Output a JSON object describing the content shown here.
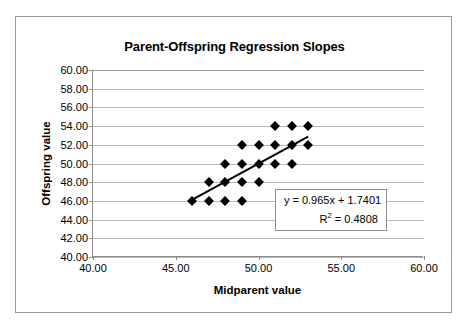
{
  "chart_data": {
    "type": "scatter",
    "title": "Parent-Offspring Regression Slopes",
    "xlabel": "Midparent value",
    "ylabel": "Offspring value",
    "xlim": [
      40.0,
      60.0
    ],
    "ylim": [
      40.0,
      60.0
    ],
    "xticks": [
      "40.00",
      "45.00",
      "50.00",
      "55.00",
      "60.00"
    ],
    "xtick_values": [
      40,
      45,
      50,
      55,
      60
    ],
    "yticks": [
      "40.00",
      "42.00",
      "44.00",
      "46.00",
      "48.00",
      "50.00",
      "52.00",
      "54.00",
      "56.00",
      "58.00",
      "60.00"
    ],
    "ytick_values": [
      40,
      42,
      44,
      46,
      48,
      50,
      52,
      54,
      56,
      58,
      60
    ],
    "grid": "horizontal",
    "legend": "none",
    "marker": "diamond",
    "marker_color": "#000000",
    "points": [
      {
        "x": 46,
        "y": 46
      },
      {
        "x": 47,
        "y": 46
      },
      {
        "x": 48,
        "y": 46
      },
      {
        "x": 49,
        "y": 46
      },
      {
        "x": 47,
        "y": 48
      },
      {
        "x": 48,
        "y": 48
      },
      {
        "x": 49,
        "y": 48
      },
      {
        "x": 50,
        "y": 48
      },
      {
        "x": 48,
        "y": 50
      },
      {
        "x": 49,
        "y": 50
      },
      {
        "x": 50,
        "y": 50
      },
      {
        "x": 51,
        "y": 50
      },
      {
        "x": 52,
        "y": 50
      },
      {
        "x": 49,
        "y": 52
      },
      {
        "x": 50,
        "y": 52
      },
      {
        "x": 51,
        "y": 52
      },
      {
        "x": 52,
        "y": 52
      },
      {
        "x": 53,
        "y": 52
      },
      {
        "x": 51,
        "y": 54
      },
      {
        "x": 52,
        "y": 54
      },
      {
        "x": 53,
        "y": 54
      }
    ],
    "trendline": {
      "slope": 0.965,
      "intercept": 1.7401,
      "x_start": 46,
      "x_end": 53,
      "color": "#000000"
    },
    "annotations": {
      "equation": "y = 0.965x + 1.7401",
      "r_squared_prefix": "R",
      "r_squared_exponent": "2",
      "r_squared_value": " = 0.4808"
    }
  }
}
